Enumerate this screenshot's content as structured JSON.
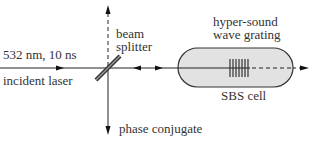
{
  "diagram": {
    "title": "",
    "labels": {
      "laser_params": "532 nm, 10 ns",
      "incident_laser": "incident laser",
      "beam_splitter_line1": "beam",
      "beam_splitter_line2": "splitter",
      "grating_line1": "hyper-sound",
      "grating_line2": "wave grating",
      "cell": "SBS cell",
      "phase_conjugate": "phase conjugate"
    },
    "components": [
      {
        "id": "incident-laser-beam",
        "type": "arrow",
        "direction": "right"
      },
      {
        "id": "beam-splitter",
        "type": "plate",
        "orientation": "diagonal"
      },
      {
        "id": "transmitted-beam-up",
        "type": "dashed-arrow",
        "direction": "up"
      },
      {
        "id": "phase-conjugate-beam",
        "type": "arrow",
        "direction": "down"
      },
      {
        "id": "bidirectional-beam",
        "type": "double-arrow",
        "direction": "left-right"
      },
      {
        "id": "sbs-cell",
        "type": "capsule",
        "fill": "#e2e2e2"
      },
      {
        "id": "hyper-sound-grating",
        "type": "grating",
        "lines": 7
      },
      {
        "id": "transmitted-beam-out",
        "type": "dashed-arrow",
        "direction": "right"
      }
    ],
    "colors": {
      "line": "#222222",
      "cell_fill": "#e2e2e2",
      "splitter_fill": "#888888"
    }
  }
}
